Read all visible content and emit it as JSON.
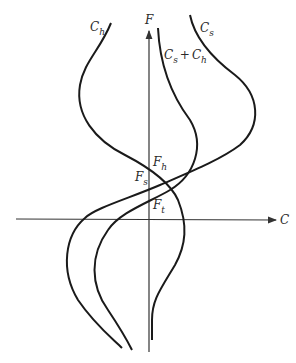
{
  "diagram": {
    "axes": {
      "vertical_label": "F",
      "horizontal_label": "C"
    },
    "curves": [
      {
        "id": "ch",
        "label_main": "C",
        "label_sub": "h"
      },
      {
        "id": "cs",
        "label_main": "C",
        "label_sub": "s"
      },
      {
        "id": "sum",
        "label_main1": "C",
        "label_sub1": "s",
        "plus": "+",
        "label_main2": "C",
        "label_sub2": "h"
      }
    ],
    "points": [
      {
        "id": "fh",
        "main": "F",
        "sub": "h"
      },
      {
        "id": "fs",
        "main": "F",
        "sub": "s"
      },
      {
        "id": "ft",
        "main": "F",
        "sub": "t"
      }
    ],
    "colors": {
      "line": "#1a1a1a",
      "axis": "#333333"
    }
  }
}
